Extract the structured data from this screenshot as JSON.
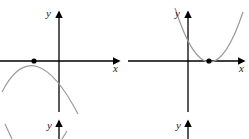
{
  "figure": {
    "panels": [
      {
        "id": "top-left",
        "x_label": "x",
        "y_label": "y",
        "curve": "parabola opening downward",
        "vertex_on_x_axis": "negative x",
        "marked_point": "vertex (touches x-axis)"
      },
      {
        "id": "top-right",
        "x_label": "x",
        "y_label": "y",
        "curve": "parabola opening upward",
        "vertex_on_x_axis": "positive x",
        "marked_point": "vertex (touches x-axis)"
      },
      {
        "id": "bottom-left",
        "x_label": "",
        "y_label": "y",
        "curve": "partial curve (cut off)"
      },
      {
        "id": "bottom-right",
        "x_label": "",
        "y_label": "y",
        "curve": "none visible"
      }
    ],
    "colors": {
      "axis": "#000000",
      "curve": "#9a9a9a",
      "point": "#000000"
    }
  }
}
